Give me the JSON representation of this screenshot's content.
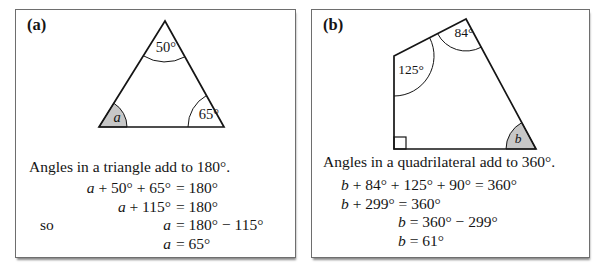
{
  "colors": {
    "panel_border": "#6e6e6e",
    "shape_line": "#151515",
    "wedge_fill": "#c7c7c7",
    "text": "#151515",
    "background": "#ffffff"
  },
  "panels": [
    {
      "label": "(a)",
      "statement": "Angles in a triangle add to 180°.",
      "figure": {
        "type": "triangle",
        "angle_labels": {
          "apex": "50°",
          "bottom_right": "65°",
          "bottom_left": "a"
        },
        "shaded_angle": "bottom_left"
      },
      "equations": {
        "mode": "align-equals",
        "rows": [
          {
            "prefix": "",
            "lhs": "a + 50° + 65°",
            "rhs": "= 180°"
          },
          {
            "prefix": "",
            "lhs": "a + 115°",
            "rhs": "= 180°"
          },
          {
            "prefix": "so",
            "lhs": "a",
            "rhs": "= 180° − 115°"
          },
          {
            "prefix": "",
            "lhs": "a",
            "rhs": "= 65°"
          }
        ]
      }
    },
    {
      "label": "(b)",
      "statement": "Angles in a quadrilateral add to 360°.",
      "figure": {
        "type": "quadrilateral",
        "angle_labels": {
          "top": "84°",
          "left": "125°",
          "bottom_right": "b"
        },
        "bottom_left_marker": "right-angle-square",
        "shaded_angle": "bottom_right"
      },
      "equations": {
        "mode": "left",
        "rows": [
          {
            "text": "b + 84° + 125° + 90° = 360°",
            "indent": 0
          },
          {
            "text": "b + 299° = 360°",
            "indent": 0
          },
          {
            "text": "b = 360° − 299°",
            "indent": 1
          },
          {
            "text": "b = 61°",
            "indent": 1
          }
        ]
      }
    }
  ]
}
